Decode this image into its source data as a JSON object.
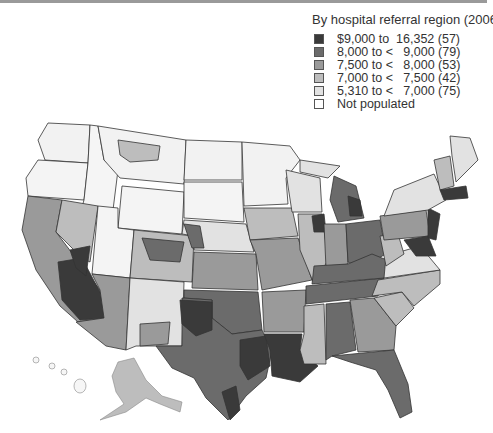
{
  "legend": {
    "title": "By hospital referral region (2006)",
    "items": [
      {
        "label": "$9,000 to  16,352 (57)",
        "color": "#3a3a3a"
      },
      {
        "label": "8,000 to <   9,000 (79)",
        "color": "#6b6b6b"
      },
      {
        "label": "7,500 to <   8,000 (53)",
        "color": "#9a9a9a"
      },
      {
        "label": "7,000 to <   7,500 (42)",
        "color": "#bdbdbd"
      },
      {
        "label": "5,310 to <   7,000 (75)",
        "color": "#e2e2e2"
      },
      {
        "label": "Not populated",
        "color": "#ffffff"
      }
    ]
  },
  "map": {
    "subject": "United States hospital referral regions",
    "insets": [
      "Alaska",
      "Hawaii"
    ]
  }
}
